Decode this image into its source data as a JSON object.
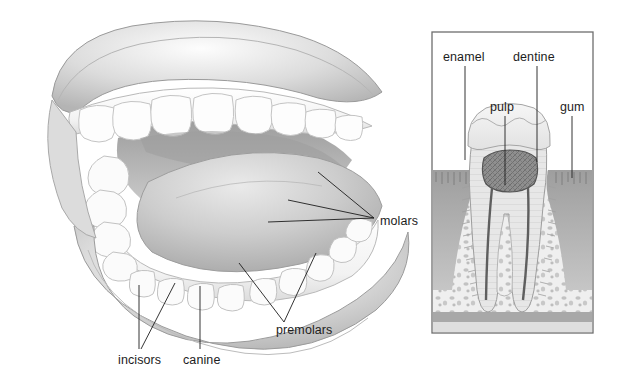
{
  "figure": {
    "background_color": "#ffffff",
    "ink_color": "#1d1d1d",
    "label_font_size_px": 12.5
  },
  "mouth_diagram": {
    "name": "open-mouth-illustration",
    "description": "Shaded pencil illustration of an open human mouth viewed from the front-right, showing upper lip, upper teeth arch, tongue, lower teeth arch and lower lip.",
    "parts": [
      {
        "name": "upper-lip",
        "shade": "#d8d8d8"
      },
      {
        "name": "upper-teeth-arch",
        "shade": "#fbfbfb"
      },
      {
        "name": "tongue",
        "shade": "#cfcfcf"
      },
      {
        "name": "lower-teeth-arch",
        "shade": "#fbfbfb"
      },
      {
        "name": "lower-lip",
        "shade": "#d2d2d2"
      },
      {
        "name": "oral-cavity-shadow",
        "shade": "#9a9a9a"
      }
    ],
    "labels": [
      {
        "id": "molars",
        "text": "molars",
        "text_x": 380,
        "text_y": 222,
        "anchor": "start",
        "leaders": [
          {
            "x1": 374,
            "y1": 218,
            "x2": 318,
            "y2": 172
          },
          {
            "x1": 374,
            "y1": 218,
            "x2": 288,
            "y2": 200
          },
          {
            "x1": 374,
            "y1": 218,
            "x2": 268,
            "y2": 222
          }
        ]
      },
      {
        "id": "premolars",
        "text": "premolars",
        "text_x": 276,
        "text_y": 331,
        "anchor": "start",
        "leaders": [
          {
            "x1": 284,
            "y1": 322,
            "x2": 316,
            "y2": 253
          },
          {
            "x1": 284,
            "y1": 322,
            "x2": 239,
            "y2": 263
          }
        ]
      },
      {
        "id": "incisors",
        "text": "incisors",
        "text_x": 118,
        "text_y": 362,
        "anchor": "start",
        "leaders": [
          {
            "x1": 139,
            "y1": 349,
            "x2": 139,
            "y2": 285
          },
          {
            "x1": 141,
            "y1": 349,
            "x2": 175,
            "y2": 283
          }
        ]
      },
      {
        "id": "canine",
        "text": "canine",
        "text_x": 183,
        "text_y": 362,
        "anchor": "start",
        "leaders": [
          {
            "x1": 200,
            "y1": 349,
            "x2": 200,
            "y2": 286
          }
        ]
      }
    ]
  },
  "tooth_panel": {
    "name": "tooth-cross-section-panel",
    "description": "Framed vertical cross-section through a two-rooted molar set in the gum and jawbone.",
    "frame": {
      "x": 432,
      "y": 32,
      "width": 161,
      "height": 301,
      "border_color": "#6e6e6e"
    },
    "structures": [
      {
        "name": "enamel-layer",
        "shade": "#efefef"
      },
      {
        "name": "dentine-layer",
        "shade": "#e3e3e3"
      },
      {
        "name": "pulp-chamber",
        "shade": "#8d8d8d"
      },
      {
        "name": "root-canal",
        "shade": "#9b9b9b"
      },
      {
        "name": "gum-tissue",
        "shade": "#b4b4b4"
      },
      {
        "name": "spongy-bone",
        "shade": "#d6d6d6"
      },
      {
        "name": "jawbone-base",
        "shade": "#a8a8a8"
      }
    ],
    "labels": [
      {
        "id": "enamel",
        "text": "enamel",
        "text_x": 443,
        "text_y": 58,
        "anchor": "start",
        "leaders": [
          {
            "x1": 465,
            "y1": 66,
            "x2": 465,
            "y2": 160
          }
        ]
      },
      {
        "id": "dentine",
        "text": "dentine",
        "text_x": 513,
        "text_y": 58,
        "anchor": "start",
        "leaders": [
          {
            "x1": 537,
            "y1": 66,
            "x2": 537,
            "y2": 162
          }
        ]
      },
      {
        "id": "pulp",
        "text": "pulp",
        "text_x": 490,
        "text_y": 108,
        "anchor": "start",
        "leaders": [
          {
            "x1": 505,
            "y1": 116,
            "x2": 505,
            "y2": 185
          }
        ]
      },
      {
        "id": "gum",
        "text": "gum",
        "text_x": 560,
        "text_y": 108,
        "anchor": "start",
        "leaders": [
          {
            "x1": 572,
            "y1": 116,
            "x2": 572,
            "y2": 178
          }
        ]
      }
    ]
  }
}
